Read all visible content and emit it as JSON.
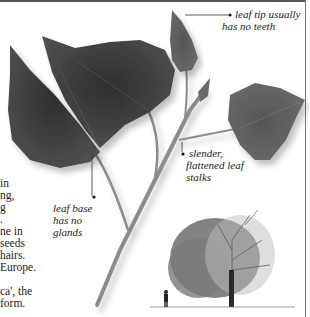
{
  "page": {
    "type": "field-guide-page",
    "body_text_fragments": [
      " in",
      "ng,",
      "g",
      ".",
      "ne in",
      "seeds",
      "hairs.",
      "Europe.",
      "",
      "ca', the",
      "form."
    ]
  },
  "annotations": {
    "leaf_tip": {
      "line1": "leaf tip usually",
      "line2": "has no teeth"
    },
    "leaf_stalks": {
      "line1": "slender,",
      "line2": "flattened leaf",
      "line3": "stalks"
    },
    "leaf_base": {
      "line1": "leaf base",
      "line2": "has no",
      "line3": "glands"
    }
  },
  "illustrations": {
    "main": "poplar-leafy-twig",
    "inset": "mature-tree-silhouette-with-human-scale-figure"
  },
  "colors": {
    "leaf_dark": "#3a3a3a",
    "leaf_mid": "#5a5a5a",
    "stem": "#8a8a8a",
    "rule": "#555555"
  }
}
